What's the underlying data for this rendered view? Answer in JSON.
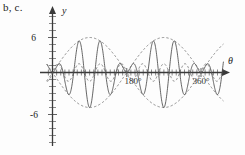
{
  "figure": {
    "caption": "b, c.",
    "background_color": "#fdfdfd",
    "solid_curve_color": "#4a4a4a",
    "dashed_curve_color": "#6b6b6b",
    "axis_color": "#3a3a3a"
  },
  "chart_data": {
    "type": "line",
    "title": "",
    "xlabel": "θ",
    "ylabel": "y",
    "xlim": [
      -20,
      420
    ],
    "ylim": [
      -9,
      9
    ],
    "grid": false,
    "legend": "none",
    "x_tick_labels": [
      "180°",
      "360°"
    ],
    "x_tick_values": [
      180,
      360
    ],
    "y_tick_labels": [
      "6",
      "-6"
    ],
    "y_tick_values": [
      6,
      -6
    ],
    "y_minor_tick_step": 1,
    "x_minor_tick_step": 10,
    "annotations": [],
    "series": [
      {
        "name": "envelope",
        "style": "dashed",
        "formula": "y = 6 sin(theta)",
        "amplitude": 6,
        "period_deg": 360,
        "description": "slow dashed sinusoidal envelope peaking at +6 near 90 degrees and -6 near 270 degrees"
      },
      {
        "name": "modulated-oscillation",
        "style": "solid",
        "formula": "y = 6 sin(theta) * sin(7 theta)",
        "amplitude": 6,
        "carrier_period_deg": 51.4,
        "description": "fast solid oscillation whose amplitude follows the dashed envelope, producing beats with nodes at 0, 180 and 360 degrees"
      },
      {
        "name": "inner-ripple",
        "style": "dashed",
        "formula": "y = 1.5 sin(7 theta)",
        "amplitude": 1.5,
        "period_deg": 51.4,
        "description": "small dashed fast ripple of constant amplitude about 1.5 near the axis"
      }
    ]
  }
}
